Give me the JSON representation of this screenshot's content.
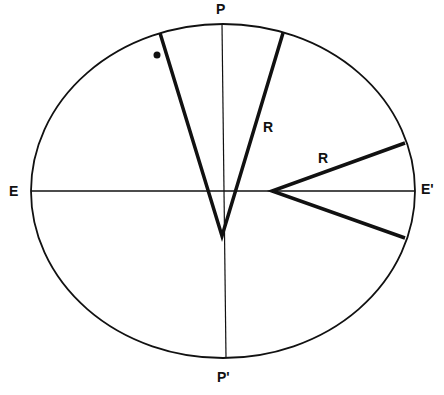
{
  "diagram": {
    "labels": {
      "top_pole": "P",
      "bottom_pole": "P'",
      "left_equator": "E",
      "right_equator": "E'",
      "radius_upper": "R",
      "radius_right": "R"
    },
    "colors": {
      "stroke": "#111111",
      "background": "#ffffff"
    },
    "ellipse": {
      "cx": 223,
      "cy": 191,
      "rx": 192,
      "ry": 167
    },
    "axes": {
      "horizontal": {
        "x1": 31,
        "y1": 191,
        "x2": 415,
        "y2": 191
      },
      "vertical": {
        "x1": 222,
        "y1": 24,
        "x2": 226,
        "y2": 358
      }
    },
    "wedges": [
      {
        "name": "polar-wedge",
        "vertex": [
          222,
          236
        ],
        "ends": [
          [
            160,
            33
          ],
          [
            283,
            33
          ]
        ]
      },
      {
        "name": "equatorial-wedge",
        "vertex": [
          272,
          191
        ],
        "ends": [
          [
            405,
            143
          ],
          [
            405,
            238
          ]
        ]
      }
    ],
    "marker_dot": {
      "cx": 157,
      "cy": 55,
      "r": 3.5
    }
  }
}
